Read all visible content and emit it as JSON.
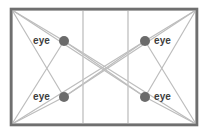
{
  "figure": {
    "type": "geometry-diagram",
    "background_color": "#ffffff",
    "frame": {
      "name": "rectangular-room-outline",
      "x": 10,
      "y": 8,
      "width": 188,
      "height": 118,
      "stroke_color": "#6f6f6f",
      "stroke_width": 3,
      "inner_stroke_color": "#b9b9b9",
      "inner_stroke_width": 1
    },
    "ray_color": "#bdbdbd",
    "ray_width": 1.2,
    "vertical_lines": [
      {
        "name": "vertical-divider-left",
        "x": 83
      },
      {
        "name": "vertical-divider-right",
        "x": 128
      }
    ],
    "corners": [
      {
        "name": "corner-top-left",
        "x": 12,
        "y": 10
      },
      {
        "name": "corner-top-right",
        "x": 196,
        "y": 10
      },
      {
        "name": "corner-bottom-left",
        "x": 12,
        "y": 124
      },
      {
        "name": "corner-bottom-right",
        "x": 196,
        "y": 124
      }
    ],
    "points": [
      {
        "name": "eye-point-top-left",
        "label": "eye",
        "label_side": "left",
        "x": 64,
        "y": 41,
        "radius": 5,
        "color": "#6b6b6b"
      },
      {
        "name": "eye-point-top-right",
        "label": "eye",
        "label_side": "right",
        "x": 145,
        "y": 41,
        "radius": 5,
        "color": "#6b6b6b"
      },
      {
        "name": "eye-point-bottom-left",
        "label": "eye",
        "label_side": "left",
        "x": 64,
        "y": 97,
        "radius": 5,
        "color": "#6b6b6b"
      },
      {
        "name": "eye-point-bottom-right",
        "label": "eye",
        "label_side": "right",
        "x": 145,
        "y": 97,
        "radius": 5,
        "color": "#6b6b6b"
      }
    ],
    "labels": {
      "top_left": "eye",
      "top_right": "eye",
      "bottom_left": "eye",
      "bottom_right": "eye"
    }
  }
}
